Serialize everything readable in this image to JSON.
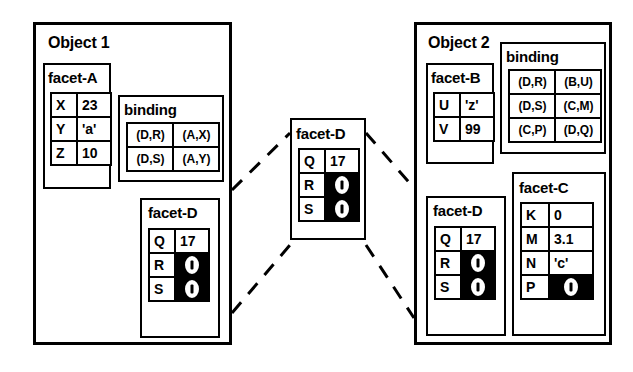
{
  "diagram": {
    "title_left": "Object 1",
    "title_right": "Object 2",
    "pointer_symbol_name": "pointer-oval-glyph"
  },
  "object1": {
    "label": "Object 1",
    "facetA": {
      "title": "facet-A",
      "rows": [
        {
          "key": "X",
          "value": "23"
        },
        {
          "key": "Y",
          "value": "'a'"
        },
        {
          "key": "Z",
          "value": "10"
        }
      ]
    },
    "binding": {
      "title": "binding",
      "rows": [
        {
          "left": "(D,R)",
          "right": "(A,X)"
        },
        {
          "left": "(D,S)",
          "right": "(A,Y)"
        }
      ]
    },
    "facetD": {
      "title": "facet-D",
      "rows": [
        {
          "key": "Q",
          "value": "17",
          "pointer": false
        },
        {
          "key": "R",
          "value": "",
          "pointer": true
        },
        {
          "key": "S",
          "value": "",
          "pointer": true
        }
      ]
    }
  },
  "center": {
    "facetD": {
      "title": "facet-D",
      "rows": [
        {
          "key": "Q",
          "value": "17",
          "pointer": false
        },
        {
          "key": "R",
          "value": "",
          "pointer": true
        },
        {
          "key": "S",
          "value": "",
          "pointer": true
        }
      ]
    }
  },
  "object2": {
    "label": "Object 2",
    "facetB": {
      "title": "facet-B",
      "rows": [
        {
          "key": "U",
          "value": "'z'"
        },
        {
          "key": "V",
          "value": "99"
        }
      ]
    },
    "binding": {
      "title": "binding",
      "rows": [
        {
          "left": "(D,R)",
          "right": "(B,U)"
        },
        {
          "left": "(D,S)",
          "right": "(C,M)"
        },
        {
          "left": "(C,P)",
          "right": "(D,Q)"
        }
      ]
    },
    "facetD": {
      "title": "facet-D",
      "rows": [
        {
          "key": "Q",
          "value": "17",
          "pointer": false
        },
        {
          "key": "R",
          "value": "",
          "pointer": true
        },
        {
          "key": "S",
          "value": "",
          "pointer": true
        }
      ]
    },
    "facetC": {
      "title": "facet-C",
      "rows": [
        {
          "key": "K",
          "value": "0",
          "pointer": false
        },
        {
          "key": "M",
          "value": "3.1",
          "pointer": false
        },
        {
          "key": "N",
          "value": "'c'",
          "pointer": false
        },
        {
          "key": "P",
          "value": "",
          "pointer": true
        }
      ]
    }
  },
  "colors": {
    "stroke": "#000000",
    "background": "#ffffff"
  }
}
